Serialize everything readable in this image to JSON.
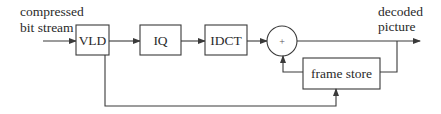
{
  "diagram": {
    "type": "block-diagram",
    "title": "",
    "input_label": [
      "compressed",
      "bit stream"
    ],
    "output_label": [
      "decoded",
      "picture"
    ],
    "blocks": [
      {
        "id": "vld",
        "label": "VLD"
      },
      {
        "id": "iq",
        "label": "IQ"
      },
      {
        "id": "idct",
        "label": "IDCT"
      },
      {
        "id": "adder",
        "label": "+"
      },
      {
        "id": "frame_store",
        "label": "frame store"
      }
    ],
    "connections": [
      {
        "from": "input",
        "to": "vld"
      },
      {
        "from": "vld",
        "to": "iq"
      },
      {
        "from": "iq",
        "to": "idct"
      },
      {
        "from": "idct",
        "to": "adder"
      },
      {
        "from": "adder",
        "to": "output"
      },
      {
        "from": "output",
        "to": "frame_store"
      },
      {
        "from": "frame_store",
        "to": "adder"
      },
      {
        "from": "vld",
        "to": "frame_store"
      }
    ]
  }
}
